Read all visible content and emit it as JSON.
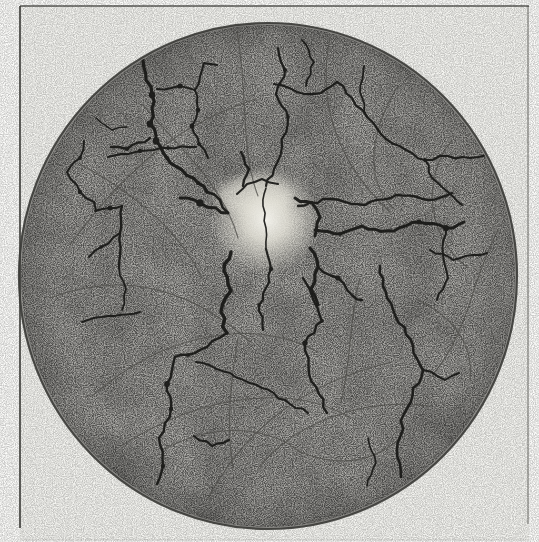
{
  "figure": {
    "kind": "engraved-plate",
    "canvas": {
      "width": 539,
      "height": 542
    },
    "colors": {
      "page": "#fcfcfa",
      "plate_bg": "#f4f4f0",
      "field_gray": "#b2b1ad",
      "rim_stroke": "#38settle",
      "rim": "#3a3a36",
      "crack": "#171715",
      "vein": "#4e4d49",
      "glow_core": "#f5f4ee",
      "glow_mid": "#e6e4da",
      "frame": "#3c3c38"
    },
    "frame": {
      "lines": [
        {
          "x1": 20,
          "y1": 6,
          "x2": 529,
          "y2": 6,
          "w": 1.6,
          "op": 0.85
        },
        {
          "x1": 20,
          "y1": 6,
          "x2": 20,
          "y2": 528,
          "w": 1.8,
          "op": 0.9
        },
        {
          "x1": 528,
          "y1": 6,
          "x2": 528,
          "y2": 524,
          "w": 1.3,
          "op": 0.55
        },
        {
          "x1": 20,
          "y1": 540,
          "x2": 529,
          "y2": 540,
          "w": 1.0,
          "op": 0.15
        }
      ]
    },
    "circle": {
      "cx": 268,
      "cy": 276,
      "rx": 249,
      "ry": 253,
      "stroke_w": 2.2
    },
    "disc": {
      "cx": 266,
      "cy": 220,
      "r": 55,
      "halo_cx": 254,
      "halo_cy": 196,
      "halo_rx": 38,
      "halo_ry": 19
    },
    "cracks": [
      {
        "w": 3.2,
        "p": [
          [
            143,
            60
          ],
          [
            146,
            80
          ],
          [
            152,
            95
          ],
          [
            152,
            108
          ],
          [
            150,
            124
          ],
          [
            156,
            141
          ],
          [
            167,
            158
          ],
          [
            182,
            170
          ],
          [
            198,
            183
          ],
          [
            207,
            192
          ]
        ]
      },
      {
        "w": 2.4,
        "p": [
          [
            150,
            138
          ],
          [
            127,
            149
          ],
          [
            111,
            147
          ]
        ]
      },
      {
        "w": 2.0,
        "p": [
          [
            84,
            141
          ],
          [
            80,
            158
          ],
          [
            67,
            172
          ],
          [
            80,
            192
          ],
          [
            94,
            202
          ],
          [
            96,
            211
          ]
        ]
      },
      {
        "w": 2.2,
        "p": [
          [
            108,
            157
          ],
          [
            140,
            151
          ],
          [
            168,
            148
          ],
          [
            196,
            147
          ]
        ]
      },
      {
        "w": 2.0,
        "p": [
          [
            95,
            211
          ],
          [
            110,
            208
          ],
          [
            122,
            206
          ]
        ]
      },
      {
        "w": 2.4,
        "p": [
          [
            122,
            206
          ],
          [
            120,
            233
          ],
          [
            119,
            268
          ]
        ]
      },
      {
        "w": 2.0,
        "p": [
          [
            120,
            233
          ],
          [
            101,
            247
          ],
          [
            89,
            257
          ]
        ]
      },
      {
        "w": 1.8,
        "p": [
          [
            119,
            268
          ],
          [
            126,
            289
          ],
          [
            122,
            310
          ]
        ]
      },
      {
        "w": 2.0,
        "p": [
          [
            82,
            322
          ],
          [
            108,
            316
          ],
          [
            140,
            312
          ]
        ]
      },
      {
        "w": 1.4,
        "p": [
          [
            96,
            118
          ],
          [
            112,
            130
          ],
          [
            127,
            127
          ]
        ]
      },
      {
        "w": 2.0,
        "p": [
          [
            157,
            89
          ],
          [
            180,
            86
          ],
          [
            195,
            90
          ]
        ]
      },
      {
        "w": 2.0,
        "p": [
          [
            195,
            90
          ],
          [
            204,
            63
          ],
          [
            217,
            65
          ]
        ]
      },
      {
        "w": 2.0,
        "p": [
          [
            195,
            90
          ],
          [
            198,
            110
          ],
          [
            192,
            126
          ],
          [
            199,
            144
          ],
          [
            208,
            158
          ]
        ]
      },
      {
        "w": 2.2,
        "p": [
          [
            278,
            48
          ],
          [
            285,
            70
          ],
          [
            276,
            94
          ],
          [
            288,
            117
          ],
          [
            282,
            147
          ],
          [
            274,
            169
          ],
          [
            266,
            186
          ]
        ]
      },
      {
        "w": 1.6,
        "p": [
          [
            266,
            188
          ],
          [
            263,
            206
          ],
          [
            266,
            228
          ],
          [
            266,
            249
          ]
        ]
      },
      {
        "w": 2.2,
        "p": [
          [
            274,
            84
          ],
          [
            297,
            92
          ],
          [
            321,
            93
          ],
          [
            337,
            82
          ]
        ]
      },
      {
        "w": 2.2,
        "p": [
          [
            337,
            82
          ],
          [
            352,
            98
          ],
          [
            367,
            117
          ],
          [
            386,
            139
          ]
        ]
      },
      {
        "w": 1.8,
        "p": [
          [
            367,
            117
          ],
          [
            360,
            92
          ],
          [
            364,
            66
          ]
        ]
      },
      {
        "w": 2.2,
        "p": [
          [
            386,
            139
          ],
          [
            406,
            150
          ],
          [
            425,
            160
          ],
          [
            448,
            156
          ],
          [
            470,
            158
          ],
          [
            487,
            155
          ]
        ]
      },
      {
        "w": 2.0,
        "p": [
          [
            425,
            160
          ],
          [
            432,
            178
          ],
          [
            448,
            192
          ],
          [
            462,
            205
          ]
        ]
      },
      {
        "w": 1.8,
        "p": [
          [
            302,
            40
          ],
          [
            314,
            62
          ],
          [
            306,
            86
          ]
        ]
      },
      {
        "w": 2.4,
        "p": [
          [
            298,
            206
          ],
          [
            330,
            199
          ],
          [
            365,
            205
          ],
          [
            396,
            195
          ],
          [
            428,
            200
          ],
          [
            452,
            193
          ]
        ]
      },
      {
        "w": 3.0,
        "p": [
          [
            315,
            230
          ],
          [
            340,
            234
          ],
          [
            362,
            226
          ],
          [
            394,
            231
          ],
          [
            419,
            222
          ],
          [
            446,
            228
          ],
          [
            464,
            222
          ]
        ]
      },
      {
        "w": 2.0,
        "p": [
          [
            430,
            250
          ],
          [
            453,
            260
          ],
          [
            487,
            253
          ]
        ]
      },
      {
        "w": 2.0,
        "p": [
          [
            446,
            227
          ],
          [
            443,
            255
          ],
          [
            448,
            278
          ],
          [
            437,
            300
          ]
        ]
      },
      {
        "w": 3.4,
        "p": [
          [
            231,
            252
          ],
          [
            224,
            271
          ],
          [
            231,
            291
          ],
          [
            221,
            312
          ],
          [
            227,
            333
          ]
        ]
      },
      {
        "w": 3.2,
        "p": [
          [
            310,
            248
          ],
          [
            318,
            267
          ],
          [
            311,
            289
          ],
          [
            318,
            305
          ]
        ]
      },
      {
        "w": 2.4,
        "p": [
          [
            318,
            267
          ],
          [
            338,
            278
          ],
          [
            353,
            296
          ],
          [
            362,
            300
          ]
        ]
      },
      {
        "w": 2.4,
        "p": [
          [
            227,
            333
          ],
          [
            207,
            347
          ],
          [
            188,
            355
          ],
          [
            175,
            357
          ]
        ]
      },
      {
        "w": 2.4,
        "p": [
          [
            175,
            357
          ],
          [
            167,
            384
          ],
          [
            171,
            409
          ],
          [
            159,
            438
          ],
          [
            163,
            466
          ],
          [
            157,
            484
          ]
        ]
      },
      {
        "w": 2.2,
        "p": [
          [
            266,
            249
          ],
          [
            271,
            269
          ],
          [
            266,
            288
          ],
          [
            259,
            305
          ],
          [
            263,
            330
          ]
        ]
      },
      {
        "w": 2.4,
        "p": [
          [
            303,
            278
          ],
          [
            322,
            321
          ],
          [
            305,
            343
          ],
          [
            309,
            374
          ],
          [
            319,
            394
          ],
          [
            327,
            413
          ]
        ]
      },
      {
        "w": 2.6,
        "p": [
          [
            380,
            266
          ],
          [
            387,
            298
          ],
          [
            413,
            346
          ],
          [
            423,
            370
          ],
          [
            404,
            414
          ],
          [
            397,
            450
          ],
          [
            401,
            477
          ]
        ]
      },
      {
        "w": 2.0,
        "p": [
          [
            423,
            370
          ],
          [
            445,
            380
          ],
          [
            459,
            373
          ]
        ]
      },
      {
        "w": 2.2,
        "p": [
          [
            194,
            436
          ],
          [
            212,
            446
          ],
          [
            229,
            440
          ]
        ]
      },
      {
        "w": 1.6,
        "p": [
          [
            368,
            438
          ],
          [
            376,
            463
          ],
          [
            367,
            486
          ]
        ]
      },
      {
        "w": 3.0,
        "p": [
          [
            180,
            198
          ],
          [
            200,
            203
          ],
          [
            216,
            208
          ],
          [
            228,
            213
          ]
        ]
      },
      {
        "w": 2.6,
        "p": [
          [
            207,
            192
          ],
          [
            220,
            200
          ],
          [
            228,
            213
          ]
        ]
      },
      {
        "w": 2.0,
        "p": [
          [
            237,
            194
          ],
          [
            247,
            184
          ],
          [
            262,
            179
          ],
          [
            278,
            184
          ]
        ]
      },
      {
        "w": 2.0,
        "p": [
          [
            196,
            362
          ],
          [
            230,
            373
          ],
          [
            262,
            388
          ],
          [
            290,
            404
          ],
          [
            308,
            413
          ]
        ]
      },
      {
        "w": 2.4,
        "p": [
          [
            241,
            152
          ],
          [
            249,
            169
          ],
          [
            243,
            186
          ]
        ]
      },
      {
        "w": 3.0,
        "p": [
          [
            295,
            198
          ],
          [
            312,
            203
          ],
          [
            320,
            217
          ],
          [
            315,
            236
          ]
        ]
      }
    ],
    "veins": [
      [
        70,
        245,
        138,
        152,
        196,
        118,
        256,
        99
      ],
      [
        50,
        298,
        128,
        268,
        196,
        293,
        250,
        342
      ],
      [
        92,
        396,
        168,
        330,
        256,
        318,
        318,
        352
      ],
      [
        121,
        446,
        208,
        390,
        298,
        386,
        350,
        418
      ],
      [
        208,
        498,
        248,
        424,
        308,
        382,
        392,
        362
      ],
      [
        258,
        468,
        298,
        420,
        366,
        398,
        428,
        406
      ],
      [
        237,
        32,
        248,
        88,
        240,
        150,
        258,
        196
      ],
      [
        330,
        38,
        318,
        96,
        332,
        158,
        390,
        212
      ],
      [
        398,
        86,
        372,
        128,
        362,
        178,
        394,
        209
      ],
      [
        452,
        140,
        420,
        180,
        428,
        238,
        468,
        268
      ],
      [
        498,
        230,
        472,
        278,
        470,
        330,
        432,
        376
      ],
      [
        80,
        164,
        128,
        190,
        178,
        228,
        202,
        278
      ],
      [
        142,
        104,
        180,
        148,
        224,
        186,
        238,
        238
      ],
      [
        238,
        338,
        230,
        385,
        226,
        428,
        233,
        468
      ],
      [
        360,
        278,
        349,
        318,
        352,
        358,
        341,
        402
      ],
      [
        162,
        450,
        220,
        420,
        270,
        428,
        300,
        452
      ],
      [
        418,
        300,
        452,
        316,
        474,
        344,
        470,
        380
      ],
      [
        300,
        452,
        340,
        468,
        372,
        462,
        398,
        440
      ]
    ]
  }
}
